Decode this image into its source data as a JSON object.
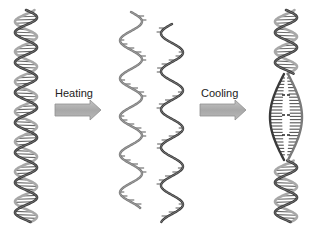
{
  "diagram": {
    "stages": [
      {
        "id": "double-helix",
        "description": "Intact double-stranded DNA helix"
      },
      {
        "id": "separated-strands",
        "description": "Two separated single strands after heating"
      },
      {
        "id": "reannealed-helix",
        "description": "Re-annealed helix with partially paired bubble region after cooling"
      }
    ],
    "arrows": [
      {
        "id": "heating",
        "label": "Heating"
      },
      {
        "id": "cooling",
        "label": "Cooling"
      }
    ],
    "colors": {
      "strand_dark": "#3a3a3a",
      "strand_mid": "#7a7a7a",
      "strand_light": "#a8a8a8",
      "rung": "#555555",
      "arrow_fill": "#a9a9a9",
      "arrow_stroke": "#8a8a8a",
      "text": "#222222",
      "background": "#ffffff"
    }
  }
}
